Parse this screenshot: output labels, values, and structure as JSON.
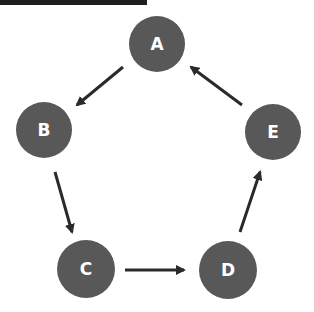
{
  "diagram": {
    "type": "directed-cycle",
    "colors": {
      "node_fill": "#585858",
      "node_label": "#ffffff",
      "edge": "#2a2a2a",
      "top_bar": "#1e1e1e"
    },
    "nodes": [
      {
        "id": "A",
        "label": "A",
        "cx": 157,
        "cy": 44,
        "r": 28
      },
      {
        "id": "B",
        "label": "B",
        "cx": 44,
        "cy": 130,
        "r": 28
      },
      {
        "id": "C",
        "label": "C",
        "cx": 86,
        "cy": 269,
        "r": 29
      },
      {
        "id": "D",
        "label": "D",
        "cx": 228,
        "cy": 270,
        "r": 29
      },
      {
        "id": "E",
        "label": "E",
        "cx": 273,
        "cy": 132,
        "r": 28
      }
    ],
    "edges": [
      {
        "from": "A",
        "to": "B",
        "x1": 123,
        "y1": 67,
        "x2": 77,
        "y2": 105
      },
      {
        "from": "B",
        "to": "C",
        "x1": 55,
        "y1": 172,
        "x2": 72,
        "y2": 232
      },
      {
        "from": "C",
        "to": "D",
        "x1": 125,
        "y1": 270,
        "x2": 184,
        "y2": 270
      },
      {
        "from": "D",
        "to": "E",
        "x1": 240,
        "y1": 232,
        "x2": 260,
        "y2": 172
      },
      {
        "from": "E",
        "to": "A",
        "x1": 242,
        "y1": 105,
        "x2": 191,
        "y2": 67
      }
    ]
  }
}
